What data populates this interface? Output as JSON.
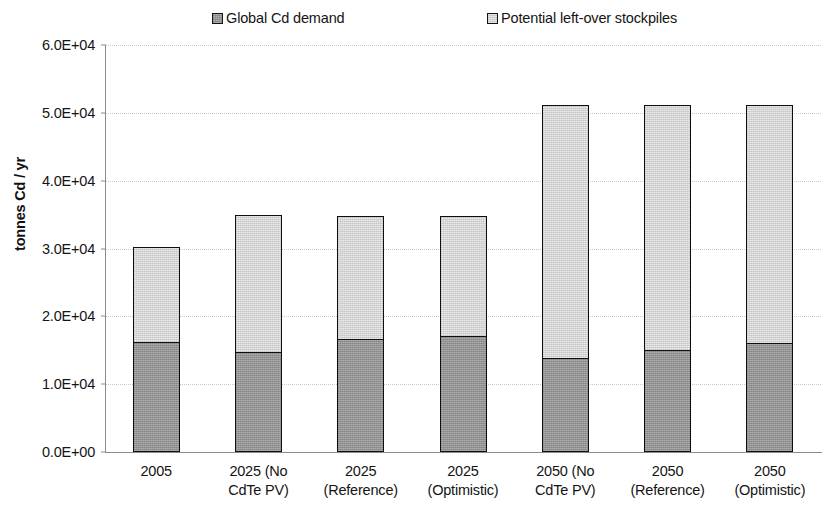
{
  "chart_data": {
    "type": "bar",
    "subtype": "stacked-bar",
    "title": "",
    "xlabel": "",
    "ylabel": "tonnes Cd / yr",
    "ylim": [
      0,
      60000
    ],
    "grid": true,
    "legend_position": "top",
    "categories": [
      "2005",
      "2025 (No CdTe PV)",
      "2025 (Reference)",
      "2025 (Optimistic)",
      "2050 (No CdTe PV)",
      "2050 (Reference)",
      "2050 (Optimistic)"
    ],
    "category_lines": [
      [
        "2005",
        ""
      ],
      [
        "2025 (No",
        "CdTe PV)"
      ],
      [
        "2025",
        "(Reference)"
      ],
      [
        "2025",
        "(Optimistic)"
      ],
      [
        "2050 (No",
        "CdTe PV)"
      ],
      [
        "2050",
        "(Reference)"
      ],
      [
        "2050",
        "(Optimistic)"
      ]
    ],
    "series": [
      {
        "name": "Global Cd demand",
        "color": "#949494",
        "values": [
          16200,
          14700,
          16700,
          17100,
          13900,
          15000,
          16100
        ]
      },
      {
        "name": "Potential left-over stockpiles",
        "color": "#d4d4d4",
        "values": [
          14300,
          20500,
          18400,
          17900,
          37550,
          36450,
          35250
        ]
      }
    ],
    "totals": [
      30500,
      35200,
      35100,
      35000,
      51450,
      51450,
      51350
    ],
    "yticks": [
      {
        "value": 0,
        "label": "0.0E+00"
      },
      {
        "value": 10000,
        "label": "1.0E+04"
      },
      {
        "value": 20000,
        "label": "2.0E+04"
      },
      {
        "value": 30000,
        "label": "3.0E+04"
      },
      {
        "value": 40000,
        "label": "4.0E+04"
      },
      {
        "value": 50000,
        "label": "5.0E+04"
      },
      {
        "value": 60000,
        "label": "6.0E+04"
      }
    ]
  },
  "legend": {
    "entries": [
      {
        "label": "Global Cd demand",
        "swatch": "#949494"
      },
      {
        "label": "Potential left-over stockpiles",
        "swatch": "#d4d4d4"
      }
    ]
  },
  "axes": {
    "y_title": "tonnes Cd / yr"
  }
}
